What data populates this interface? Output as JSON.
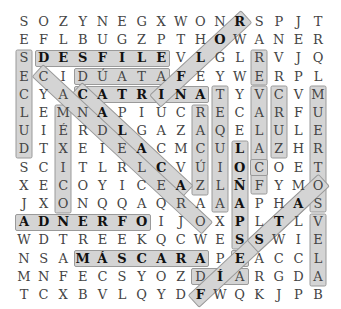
{
  "puzzle": {
    "type": "word-search",
    "rows": 16,
    "cols": 16,
    "grid": [
      "S O Z Y N E G X W O N R S P J T",
      "E F L B U G Z P T H O W A N E R",
      "S D E S F I L E V L G L R V J Q",
      "E C I D Ú A T A F E Y W E R P L",
      "C Y A C A T R I N A T Y V C V M",
      "L E M N A P I U C R E C A R F U",
      "U I É R D L G A Z A Q E L U L E",
      "D T X E I E A C M C U L A Z H R",
      "S C I T L R L C V Ú I O C O E T",
      "X E C O Y I C E A Z L Ñ F Y M O",
      "J X O N Q Q A Q R A A A P H A S",
      "A D N E R F O I J O X P L T L V",
      "W D T R E E K Q C W E S S W I E",
      "N S A M Á S C A R A P E A C C L",
      "M N F E C S Y O Z D Í A R G D A",
      "T C X B V L Q Y D F W Q K J P B"
    ],
    "highlights": [
      {
        "word": "DESFILE",
        "r0": 2,
        "c0": 1,
        "r1": 2,
        "c1": 7
      },
      {
        "word": "SECLUD",
        "r0": 2,
        "c0": 0,
        "r1": 7,
        "c1": 0
      },
      {
        "word": "DÚATA",
        "r0": 3,
        "c0": 3,
        "r1": 3,
        "c1": 7
      },
      {
        "word": "CATRINA",
        "r0": 4,
        "c0": 3,
        "r1": 4,
        "c1": 9
      },
      {
        "word": "TEQUILA",
        "r0": 4,
        "c0": 10,
        "r1": 10,
        "c1": 10
      },
      {
        "word": "VELAS",
        "r0": 4,
        "c0": 12,
        "r1": 9,
        "c1": 12
      },
      {
        "word": "CRUZ",
        "r0": 4,
        "c0": 13,
        "r1": 7,
        "c1": 13
      },
      {
        "word": "MUERTOS",
        "r0": 4,
        "c0": 15,
        "r1": 10,
        "c1": 15
      },
      {
        "word": "VELA",
        "r0": 11,
        "c0": 15,
        "r1": 14,
        "c1": 15
      },
      {
        "word": "RACÚZ",
        "r0": 5,
        "c0": 9,
        "r1": 9,
        "c1": 9
      },
      {
        "word": "LOÑAPS",
        "r0": 7,
        "c0": 11,
        "r1": 12,
        "c1": 11
      },
      {
        "word": "CO",
        "r0": 8,
        "c0": 12,
        "r1": 8,
        "c1": 12
      },
      {
        "word": "MÉXICO",
        "r0": 5,
        "c0": 2,
        "r1": 10,
        "c1": 2
      },
      {
        "word": "RE",
        "r0": 2,
        "c0": 12,
        "r1": 3,
        "c1": 12
      },
      {
        "word": "ADNERFO",
        "r0": 11,
        "c0": 0,
        "r1": 11,
        "c1": 6
      },
      {
        "word": "MÁSCARA",
        "r0": 13,
        "c0": 3,
        "r1": 13,
        "c1": 9
      },
      {
        "word": "E",
        "r0": 13,
        "c0": 11,
        "r1": 13,
        "c1": 11
      },
      {
        "word": "DÍA",
        "r0": 14,
        "c0": 9,
        "r1": 14,
        "c1": 11
      },
      {
        "word": "ROLF",
        "r0": 0,
        "c0": 11,
        "r1": 4,
        "c1": 7
      },
      {
        "word": "CALACA",
        "r0": 4,
        "c0": 3,
        "r1": 9,
        "c1": 8
      },
      {
        "word": "CANDLE",
        "r0": 3,
        "c0": 1,
        "r1": 11,
        "c1": 9
      },
      {
        "word": "FIESTA",
        "r0": 15,
        "c0": 9,
        "r1": 10,
        "c1": 14
      },
      {
        "word": "STAS",
        "r0": 12,
        "c0": 12,
        "r1": 9,
        "c1": 15
      }
    ],
    "bold_cells": [
      [
        0,
        11
      ],
      [
        1,
        10
      ],
      [
        2,
        9
      ],
      [
        3,
        8
      ],
      [
        2,
        1
      ],
      [
        2,
        2
      ],
      [
        2,
        3
      ],
      [
        2,
        4
      ],
      [
        2,
        5
      ],
      [
        2,
        6
      ],
      [
        2,
        7
      ],
      [
        4,
        3
      ],
      [
        4,
        4
      ],
      [
        4,
        5
      ],
      [
        4,
        6
      ],
      [
        4,
        7
      ],
      [
        4,
        8
      ],
      [
        4,
        9
      ],
      [
        5,
        4
      ],
      [
        6,
        5
      ],
      [
        7,
        6
      ],
      [
        8,
        7
      ],
      [
        9,
        8
      ],
      [
        7,
        11
      ],
      [
        8,
        11
      ],
      [
        9,
        11
      ],
      [
        10,
        11
      ],
      [
        11,
        11
      ],
      [
        12,
        11
      ],
      [
        10,
        14
      ],
      [
        11,
        13
      ],
      [
        12,
        12
      ],
      [
        11,
        0
      ],
      [
        11,
        1
      ],
      [
        11,
        2
      ],
      [
        11,
        3
      ],
      [
        11,
        4
      ],
      [
        11,
        5
      ],
      [
        11,
        6
      ],
      [
        13,
        3
      ],
      [
        13,
        4
      ],
      [
        13,
        5
      ],
      [
        13,
        6
      ],
      [
        13,
        7
      ],
      [
        13,
        8
      ],
      [
        13,
        9
      ],
      [
        13,
        11
      ],
      [
        14,
        10
      ],
      [
        15,
        9
      ]
    ]
  }
}
